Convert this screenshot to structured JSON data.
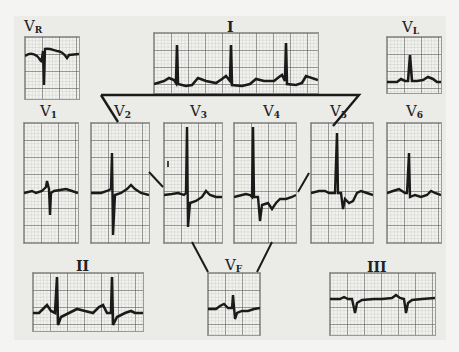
{
  "figure": {
    "trace_color": "#1a1a1a",
    "grid_color": "#5a5a5a",
    "paper_color": "#f1f1ee"
  },
  "leads": {
    "vr": {
      "main": "V",
      "sub": "R"
    },
    "i": {
      "main": "I"
    },
    "vl": {
      "main": "V",
      "sub": "L"
    },
    "v1": {
      "main": "V",
      "sub": "1"
    },
    "v2": {
      "main": "V",
      "sub": "2"
    },
    "v3": {
      "main": "V",
      "sub": "3"
    },
    "v4": {
      "main": "V",
      "sub": "4"
    },
    "v5": {
      "main": "V",
      "sub": "5"
    },
    "v6": {
      "main": "V",
      "sub": "6"
    },
    "ii": {
      "main": "II"
    },
    "vf": {
      "main": "V",
      "sub": "F"
    },
    "iii": {
      "main": "III"
    }
  }
}
